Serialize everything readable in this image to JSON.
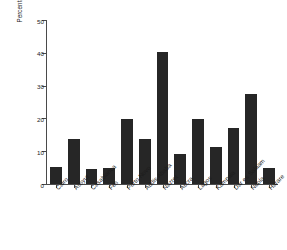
{
  "chart_data": {
    "type": "bar",
    "title": "",
    "subtitle": "",
    "xlabel": "",
    "ylabel": "Percentage of children with ARI (%)",
    "ylim": [
      0,
      50
    ],
    "yticks": [
      0,
      10,
      20,
      30,
      40,
      50
    ],
    "grid": false,
    "legend": "none",
    "bar_color": "#262626",
    "axis_color": "#4a4a4a",
    "background_color": "#ffffff",
    "categories": [
      "Cairo",
      "Assyut",
      "Casablanca",
      "Fes",
      "Porto Novo",
      "Addis Ababa",
      "Nazret",
      "Accra",
      "Lagos",
      "Kampala",
      "Dar es Salaam",
      "Ndola",
      "Harare"
    ],
    "values": [
      5.2,
      13.6,
      4.5,
      4.8,
      19.9,
      13.7,
      40.2,
      9.0,
      19.9,
      11.2,
      17.0,
      27.3,
      5.0
    ]
  }
}
